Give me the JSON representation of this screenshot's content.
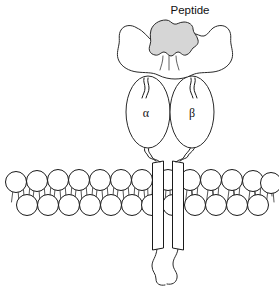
{
  "figure": {
    "name": "mhc-class-ii-peptide-membrane-diagram",
    "canvas": {
      "width": 279,
      "height": 290,
      "background": "#ffffff"
    },
    "line_color": "#1a1a1a"
  },
  "labels": {
    "peptide": "Peptide",
    "alpha_chain": "α",
    "beta_chain": "β"
  },
  "peptide_blob": {
    "fill": "#d6d6d6",
    "stroke": "#2a2a2a"
  },
  "platform": {
    "name": "mhc-binding-groove-platform",
    "fill": "#ffffff"
  },
  "domains": [
    {
      "name": "alpha-domain",
      "label": "α",
      "cx": 148,
      "cy": 112,
      "rx": 22,
      "ry": 36
    },
    {
      "name": "beta-domain",
      "label": "β",
      "cx": 192,
      "cy": 112,
      "rx": 22,
      "ry": 36
    }
  ],
  "membrane": {
    "name": "lipid-bilayer",
    "upper_leaflet_y": 181,
    "lower_leaflet_y": 205,
    "head_radius": 10.5,
    "head_spacing": 21,
    "upper_start_x": 16,
    "lower_start_x": 27,
    "upper_count": 13,
    "lower_count": 12
  },
  "transmembrane": {
    "name": "transmembrane-helices",
    "top_y": 161,
    "bottom_y": 250,
    "helices": [
      {
        "name": "alpha-transmembrane-helix",
        "x": 152.5,
        "width": 11
      },
      {
        "name": "beta-transmembrane-helix",
        "x": 172.5,
        "width": 11
      }
    ],
    "cytoplasmic_tail_end_y": 286
  }
}
